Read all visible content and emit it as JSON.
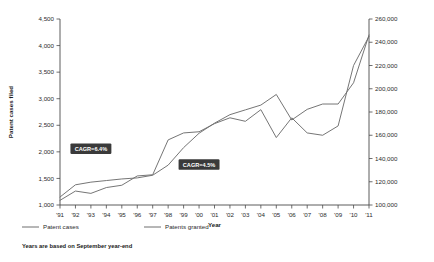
{
  "chart_data": {
    "type": "line",
    "title": "",
    "xlabel": "Year",
    "ylabel": "Patent cases filed",
    "y2label": "",
    "grid": false,
    "legend_position": "bottom-left",
    "categories": [
      "'91",
      "'92",
      "'93",
      "'94",
      "'95",
      "'96",
      "'97",
      "'98",
      "'99",
      "'00",
      "'01",
      "'02",
      "'03",
      "'04",
      "'05",
      "'06",
      "'07",
      "'08",
      "'09",
      "'10",
      "'11"
    ],
    "ylim": [
      1000,
      4500
    ],
    "yticks": [
      "1,000",
      "1,500",
      "2,000",
      "2,500",
      "3,000",
      "3,500",
      "4,000",
      "4,500"
    ],
    "y2lim": [
      100000,
      260000
    ],
    "y2ticks": [
      "100,000",
      "120,000",
      "140,000",
      "160,000",
      "180,000",
      "200,000",
      "220,000",
      "240,000",
      "260,000"
    ],
    "series": [
      {
        "name": "Patent cases",
        "axis": "left",
        "values": [
          1150,
          1380,
          1430,
          1460,
          1490,
          1510,
          1560,
          1750,
          2080,
          2350,
          2540,
          2700,
          2790,
          2880,
          3080,
          2600,
          2800,
          2900,
          2900,
          3300,
          4200
        ]
      },
      {
        "name": "Patents granted",
        "axis": "right",
        "values": [
          104000,
          112000,
          110000,
          115000,
          117000,
          125000,
          126000,
          156000,
          162000,
          163000,
          170000,
          175000,
          172000,
          182000,
          158000,
          175000,
          162000,
          160000,
          168000,
          220000,
          245000
        ]
      }
    ],
    "annotations": [
      {
        "text": "CAGR=6.4%",
        "series": "Patent cases",
        "x": "'93",
        "y": 2060
      },
      {
        "text": "CAGR=4.5%",
        "series": "Patents granted",
        "x": "'00",
        "y": 1760
      }
    ],
    "footnote": "Years are based on September year-end"
  },
  "legend": {
    "items": [
      {
        "label": "Patent cases"
      },
      {
        "label": "Patents granted"
      }
    ]
  },
  "colors": {
    "line": "#6e6e6e",
    "axis": "#4a4a4a",
    "annotation_bg": "#3a3a3a",
    "annotation_text": "#ffffff",
    "text": "#1a1a1a"
  }
}
